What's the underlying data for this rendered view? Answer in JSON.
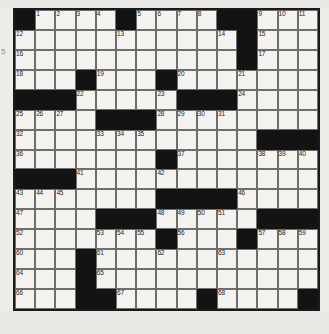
{
  "puzzle": {
    "title": "crossword-grid",
    "rows": 15,
    "cols": 15,
    "colors": {
      "block": "#131313",
      "cell": "#f4f3f0",
      "border": "#6e6e6c",
      "page_background": "#edece9",
      "number_text": "#1b1b1b"
    },
    "margin_mark": "5",
    "blocks": [
      [
        0,
        0
      ],
      [
        0,
        5
      ],
      [
        0,
        10
      ],
      [
        0,
        11
      ],
      [
        1,
        11
      ],
      [
        2,
        11
      ],
      [
        3,
        3
      ],
      [
        3,
        7
      ],
      [
        4,
        0
      ],
      [
        4,
        1
      ],
      [
        4,
        2
      ],
      [
        4,
        8
      ],
      [
        4,
        9
      ],
      [
        4,
        10
      ],
      [
        5,
        4
      ],
      [
        5,
        5
      ],
      [
        5,
        6
      ],
      [
        6,
        12
      ],
      [
        6,
        13
      ],
      [
        6,
        14
      ],
      [
        7,
        7
      ],
      [
        8,
        0
      ],
      [
        8,
        1
      ],
      [
        8,
        2
      ],
      [
        9,
        7
      ],
      [
        9,
        8
      ],
      [
        9,
        9
      ],
      [
        9,
        10
      ],
      [
        10,
        4
      ],
      [
        10,
        5
      ],
      [
        10,
        6
      ],
      [
        10,
        12
      ],
      [
        10,
        13
      ],
      [
        10,
        14
      ],
      [
        11,
        7
      ],
      [
        11,
        11
      ],
      [
        12,
        3
      ],
      [
        13,
        3
      ],
      [
        14,
        3
      ],
      [
        14,
        4
      ],
      [
        14,
        9
      ],
      [
        14,
        14
      ]
    ],
    "numbers": [
      {
        "r": 0,
        "c": 1,
        "n": "1"
      },
      {
        "r": 0,
        "c": 2,
        "n": "2"
      },
      {
        "r": 0,
        "c": 3,
        "n": "3"
      },
      {
        "r": 0,
        "c": 4,
        "n": "4"
      },
      {
        "r": 0,
        "c": 6,
        "n": "5"
      },
      {
        "r": 0,
        "c": 7,
        "n": "6"
      },
      {
        "r": 0,
        "c": 8,
        "n": "7"
      },
      {
        "r": 0,
        "c": 9,
        "n": "8"
      },
      {
        "r": 0,
        "c": 12,
        "n": "9"
      },
      {
        "r": 0,
        "c": 13,
        "n": "10"
      },
      {
        "r": 0,
        "c": 14,
        "n": "11"
      },
      {
        "r": 1,
        "c": 0,
        "n": "12"
      },
      {
        "r": 1,
        "c": 5,
        "n": "13"
      },
      {
        "r": 1,
        "c": 10,
        "n": "14"
      },
      {
        "r": 1,
        "c": 12,
        "n": "15"
      },
      {
        "r": 2,
        "c": 0,
        "n": "16"
      },
      {
        "r": 2,
        "c": 12,
        "n": "17"
      },
      {
        "r": 3,
        "c": 0,
        "n": "18"
      },
      {
        "r": 3,
        "c": 4,
        "n": "19"
      },
      {
        "r": 3,
        "c": 8,
        "n": "20"
      },
      {
        "r": 3,
        "c": 11,
        "n": "21"
      },
      {
        "r": 4,
        "c": 3,
        "n": "22"
      },
      {
        "r": 4,
        "c": 7,
        "n": "23"
      },
      {
        "r": 4,
        "c": 11,
        "n": "24"
      },
      {
        "r": 5,
        "c": 0,
        "n": "25"
      },
      {
        "r": 5,
        "c": 1,
        "n": "26"
      },
      {
        "r": 5,
        "c": 2,
        "n": "27"
      },
      {
        "r": 5,
        "c": 7,
        "n": "28"
      },
      {
        "r": 5,
        "c": 8,
        "n": "29"
      },
      {
        "r": 5,
        "c": 9,
        "n": "30"
      },
      {
        "r": 5,
        "c": 10,
        "n": "31"
      },
      {
        "r": 6,
        "c": 0,
        "n": "32"
      },
      {
        "r": 6,
        "c": 4,
        "n": "33"
      },
      {
        "r": 6,
        "c": 5,
        "n": "34"
      },
      {
        "r": 6,
        "c": 6,
        "n": "35"
      },
      {
        "r": 7,
        "c": 0,
        "n": "36"
      },
      {
        "r": 7,
        "c": 8,
        "n": "37"
      },
      {
        "r": 7,
        "c": 12,
        "n": "38"
      },
      {
        "r": 7,
        "c": 13,
        "n": "39"
      },
      {
        "r": 7,
        "c": 14,
        "n": "40"
      },
      {
        "r": 8,
        "c": 3,
        "n": "41"
      },
      {
        "r": 8,
        "c": 7,
        "n": "42"
      },
      {
        "r": 9,
        "c": 0,
        "n": "43"
      },
      {
        "r": 9,
        "c": 1,
        "n": "44"
      },
      {
        "r": 9,
        "c": 2,
        "n": "45"
      },
      {
        "r": 9,
        "c": 11,
        "n": "46"
      },
      {
        "r": 10,
        "c": 0,
        "n": "47"
      },
      {
        "r": 10,
        "c": 7,
        "n": "48"
      },
      {
        "r": 10,
        "c": 8,
        "n": "49"
      },
      {
        "r": 10,
        "c": 9,
        "n": "50"
      },
      {
        "r": 10,
        "c": 10,
        "n": "51"
      },
      {
        "r": 11,
        "c": 0,
        "n": "52"
      },
      {
        "r": 11,
        "c": 4,
        "n": "53"
      },
      {
        "r": 11,
        "c": 5,
        "n": "54"
      },
      {
        "r": 11,
        "c": 6,
        "n": "55"
      },
      {
        "r": 11,
        "c": 8,
        "n": "56"
      },
      {
        "r": 11,
        "c": 12,
        "n": "57"
      },
      {
        "r": 11,
        "c": 13,
        "n": "58"
      },
      {
        "r": 11,
        "c": 14,
        "n": "59"
      },
      {
        "r": 12,
        "c": 0,
        "n": "60"
      },
      {
        "r": 12,
        "c": 4,
        "n": "61"
      },
      {
        "r": 12,
        "c": 7,
        "n": "62"
      },
      {
        "r": 12,
        "c": 10,
        "n": "63"
      },
      {
        "r": 13,
        "c": 0,
        "n": "64"
      },
      {
        "r": 13,
        "c": 4,
        "n": "65"
      },
      {
        "r": 14,
        "c": 0,
        "n": "66"
      },
      {
        "r": 14,
        "c": 5,
        "n": "67"
      },
      {
        "r": 14,
        "c": 10,
        "n": "68"
      }
    ]
  }
}
